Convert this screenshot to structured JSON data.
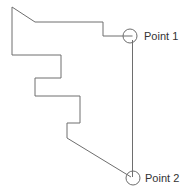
{
  "diagram": {
    "type": "outline-with-marked-points",
    "line_color": "#6e6e6e",
    "outline": {
      "points": [
        [
          12,
          7
        ],
        [
          35,
          22
        ],
        [
          103,
          22
        ],
        [
          103,
          36
        ],
        [
          126,
          36
        ]
      ],
      "steps": [
        [
          61,
          55
        ],
        [
          61,
          78
        ],
        [
          35,
          78
        ],
        [
          35,
          96
        ],
        [
          80,
          96
        ],
        [
          80,
          123
        ],
        [
          67,
          123
        ],
        [
          67,
          138
        ],
        [
          127,
          174
        ]
      ]
    },
    "points": [
      {
        "label": "Point 1",
        "cx": 130,
        "cy": 36,
        "r": 7
      },
      {
        "label": "Point 2",
        "cx": 133,
        "cy": 178,
        "r": 7
      }
    ],
    "connector": {
      "from": "Point 1",
      "to": "Point 2"
    }
  }
}
